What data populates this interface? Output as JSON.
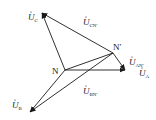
{
  "diagram": {
    "title": "",
    "points": {
      "N": {
        "label": "N",
        "x": 65,
        "y": 70
      },
      "Np": {
        "label": "N′",
        "x": 113,
        "y": 53
      },
      "A": {
        "x": 125,
        "y": 70
      },
      "B": {
        "x": 30,
        "y": 112
      },
      "C": {
        "x": 42,
        "y": 13
      }
    },
    "vectors": [
      {
        "id": "UA",
        "from": "N",
        "to": "A",
        "label_main": "U",
        "label_sub": "A"
      },
      {
        "id": "UB",
        "from": "N",
        "to": "B",
        "label_main": "U",
        "label_sub": "B"
      },
      {
        "id": "UC",
        "from": "N",
        "to": "C",
        "label_main": "U",
        "label_sub": "C"
      },
      {
        "id": "UANp",
        "from": "Np",
        "to": "A",
        "label_main": "U",
        "label_sub": "AN′"
      },
      {
        "id": "UBNp",
        "from": "Np",
        "to": "B",
        "label_main": "U",
        "label_sub": "BN′"
      },
      {
        "id": "UCNp",
        "from": "Np",
        "to": "C",
        "label_main": "U",
        "label_sub": "CN′"
      }
    ],
    "segments": [
      {
        "from": "N",
        "to": "Np"
      }
    ],
    "labels": {
      "UC": {
        "main": "U",
        "sub": "C"
      },
      "UCNp": {
        "main": "U",
        "sub": "CN′"
      },
      "UANp": {
        "main": "U",
        "sub": "AN′"
      },
      "UA": {
        "main": "U",
        "sub": "A"
      },
      "UBNp": {
        "main": "U",
        "sub": "BN′"
      },
      "UB": {
        "main": "U",
        "sub": "B"
      },
      "N": "N",
      "Np": "N′"
    },
    "colors": {
      "line": "#1a1a1a",
      "background": "#ffffff"
    }
  }
}
